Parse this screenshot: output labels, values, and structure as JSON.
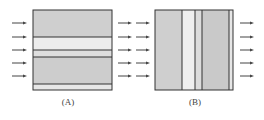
{
  "panels": [
    {
      "id": "A",
      "label": "(A)",
      "orientation": "layers-horizontal",
      "box": {
        "x": 33,
        "y": 10,
        "w": 79,
        "h": 80
      },
      "layers": [
        {
          "from": 10,
          "to": 37,
          "fill": "#cfcfcf"
        },
        {
          "from": 37,
          "to": 50,
          "fill": "#ececec"
        },
        {
          "from": 50,
          "to": 57,
          "fill": "#dedede"
        },
        {
          "from": 57,
          "to": 84,
          "fill": "#cdcdcd"
        },
        {
          "from": 84,
          "to": 90,
          "fill": "#e6e6e6"
        }
      ],
      "divider_positions": [
        37,
        50,
        57,
        84
      ],
      "arrows_in_x": [
        12,
        27
      ],
      "arrows_out_x": [
        118,
        132
      ]
    },
    {
      "id": "B",
      "label": "(B)",
      "orientation": "layers-vertical",
      "box": {
        "x": 155,
        "y": 10,
        "w": 78,
        "h": 80
      },
      "layers": [
        {
          "from": 155,
          "to": 182,
          "fill": "#cfcfcf"
        },
        {
          "from": 182,
          "to": 195,
          "fill": "#efefef"
        },
        {
          "from": 195,
          "to": 202,
          "fill": "#dcdcdc"
        },
        {
          "from": 202,
          "to": 229,
          "fill": "#c9c9c9"
        },
        {
          "from": 229,
          "to": 233,
          "fill": "#e6e6e6"
        }
      ],
      "divider_positions": [
        182,
        195,
        202,
        229
      ],
      "arrows_in_x": [
        136,
        150
      ],
      "arrows_out_x": [
        240,
        254
      ]
    }
  ],
  "arrow_rows_y": [
    23,
    37,
    50,
    63,
    76
  ],
  "colors": {
    "stroke": "#333333",
    "arrow": "#444444",
    "label": "#444444"
  }
}
